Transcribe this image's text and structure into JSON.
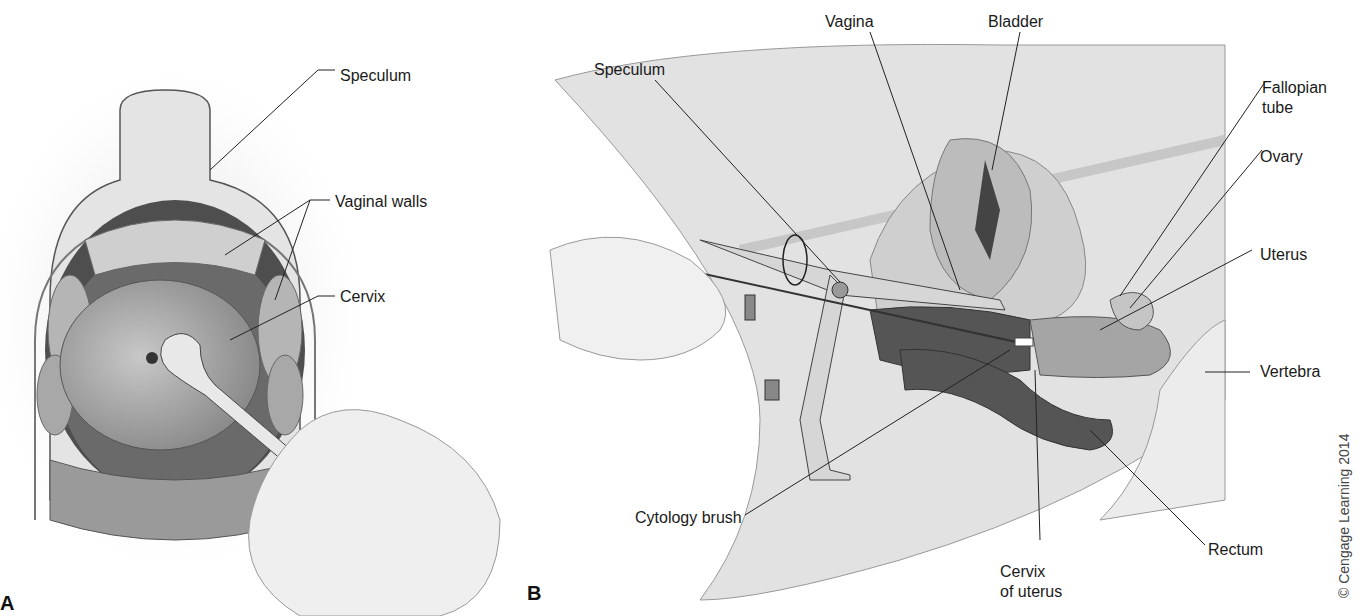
{
  "panels": {
    "a": {
      "letter": "A",
      "labels": {
        "speculum": "Speculum",
        "vaginal_walls": "Vaginal walls",
        "cervix": "Cervix"
      }
    },
    "b": {
      "letter": "B",
      "labels": {
        "vagina": "Vagina",
        "bladder": "Bladder",
        "speculum": "Speculum",
        "fallopian_tube_1": "Fallopian",
        "fallopian_tube_2": "tube",
        "ovary": "Ovary",
        "uterus": "Uterus",
        "vertebra": "Vertebra",
        "cytology_brush": "Cytology brush",
        "rectum": "Rectum",
        "cervix_of_uterus_1": "Cervix",
        "cervix_of_uterus_2": "of uterus"
      }
    }
  },
  "credit": "© Cengage Learning 2014",
  "colors": {
    "background": "#ffffff",
    "tissue_light": "#e6e6e6",
    "tissue_mid": "#bdbdbd",
    "tissue_dark": "#5a5a5a",
    "leader_line": "#222222"
  }
}
